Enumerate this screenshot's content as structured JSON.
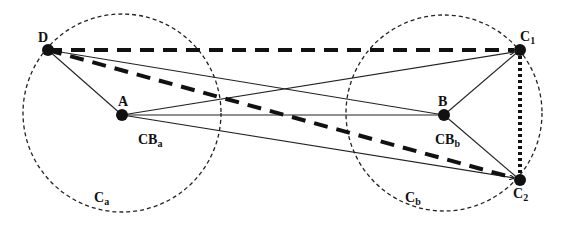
{
  "diagram": {
    "nodes": {
      "D": {
        "label": "D",
        "x": 48,
        "y": 50
      },
      "A": {
        "label": "A",
        "x": 122,
        "y": 115
      },
      "B": {
        "label": "B",
        "x": 444,
        "y": 115
      },
      "C1": {
        "label": "C",
        "sub": "1",
        "x": 520,
        "y": 50
      },
      "C2": {
        "label": "C",
        "sub": "2",
        "x": 520,
        "y": 180
      }
    },
    "regions": {
      "CBa": {
        "label": "CB",
        "sub": "a"
      },
      "CBb": {
        "label": "CB",
        "sub": "b"
      },
      "Ca": {
        "label": "C",
        "sub": "a"
      },
      "Cb": {
        "label": "C",
        "sub": "b"
      }
    },
    "colors": {
      "stroke": "#111111",
      "background": "#ffffff"
    }
  }
}
